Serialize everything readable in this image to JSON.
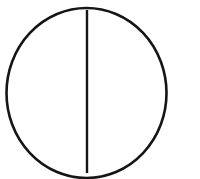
{
  "canvas": {
    "width": 200,
    "height": 179,
    "background_color": "#ffffff",
    "stroke_color": "#151515",
    "title": "Circle divided by a vertical diameter"
  },
  "figure": {
    "name": "divided-circle",
    "description": "A circle bisected by a single vertical line through its center",
    "shapes": [
      {
        "id": "outer-circle",
        "type": "circle",
        "center_x": 86.5,
        "center_y": 93,
        "radius": 80,
        "stroke_width": 2.6,
        "fill": "none",
        "stroke": "#151515"
      },
      {
        "id": "vertical-diameter",
        "type": "line",
        "x1": 87,
        "y1": 13,
        "x2": 87,
        "y2": 173,
        "stroke_width": 2.4,
        "stroke": "#151515"
      }
    ],
    "regions": [
      {
        "id": "left-half",
        "label": "left half"
      },
      {
        "id": "right-half",
        "label": "right half"
      }
    ]
  }
}
